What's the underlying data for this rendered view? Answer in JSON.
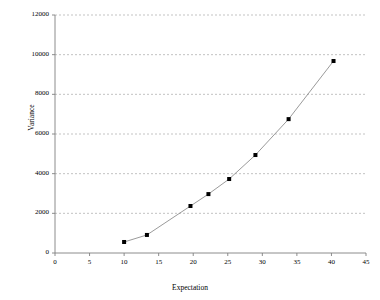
{
  "chart_data": {
    "type": "scatter",
    "title": "",
    "subtitle": "",
    "xlabel": "Expectation",
    "ylabel": "Variance",
    "xlim": [
      0,
      45
    ],
    "ylim": [
      0,
      12000
    ],
    "xticks": [
      0,
      5,
      10,
      15,
      20,
      25,
      30,
      35,
      40,
      45
    ],
    "xtick_labels": [
      "0",
      "5",
      "10",
      "15",
      "20",
      "25",
      "30",
      "35",
      "40",
      "45"
    ],
    "yticks": [
      0,
      2000,
      4000,
      6000,
      8000,
      10000,
      12000
    ],
    "ytick_labels": [
      "0",
      "2000",
      "4000",
      "6000",
      "8000",
      "10000",
      "12000"
    ],
    "grid": {
      "horizontal": true,
      "vertical": false,
      "style": "dashed",
      "color": "#9a9a9a"
    },
    "legend": null,
    "legend_position": "none",
    "marker": {
      "shape": "square",
      "color": "#000000",
      "size": 4
    },
    "line": {
      "connected": true,
      "color": "#808080",
      "width": 0.8
    },
    "series": [
      {
        "name": "Variance vs Expectation",
        "x": [
          10.0,
          13.3,
          19.6,
          22.2,
          25.2,
          29.0,
          33.8,
          40.3
        ],
        "y": [
          555,
          910,
          2370,
          2970,
          3730,
          4940,
          6750,
          9680
        ]
      }
    ],
    "annotations": []
  },
  "axes": {
    "x_title": "Expectation",
    "y_title": "Variance"
  },
  "colors": {
    "axis": "#808080",
    "grid": "#9a9a9a",
    "marker": "#000000",
    "line": "#808080",
    "background": "#ffffff"
  }
}
